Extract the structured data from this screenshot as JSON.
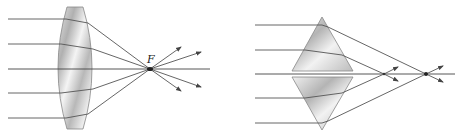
{
  "figure": {
    "panels": [
      {
        "id": "converging-lens",
        "description": "Parallel rays pass through a biconvex lens and converge at focal point F",
        "focal_label": "F"
      },
      {
        "id": "prism-pair",
        "description": "Parallel rays pass through two stacked prisms and cross the axis at different points"
      }
    ],
    "colors": {
      "ray": "#555555",
      "lens_light": "#f2f2f2",
      "lens_dark": "#a8a8a8",
      "focus": "#222222"
    }
  }
}
